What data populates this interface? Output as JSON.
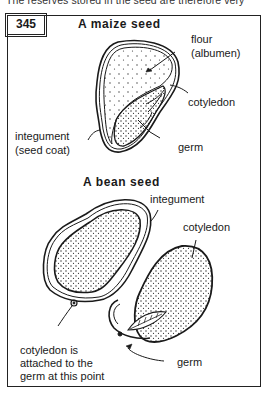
{
  "page": {
    "top_text": "The reserves stored in the seed are therefore very"
  },
  "figure": {
    "number": "345",
    "maize": {
      "title": "A maize seed",
      "labels": {
        "flour": "flour",
        "albumen": "(albumen)",
        "cotyledon": "cotyledon",
        "integument": "integument",
        "seed_coat": "(seed coat)",
        "germ": "germ"
      }
    },
    "bean": {
      "title": "A bean seed",
      "labels": {
        "integument": "integument",
        "cotyledon": "cotyledon",
        "attach_1": "cotyledon is",
        "attach_2": "attached to the",
        "attach_3": "germ at this point",
        "germ": "germ"
      }
    }
  },
  "colors": {
    "ink": "#1a1a1a",
    "background": "#ffffff"
  }
}
